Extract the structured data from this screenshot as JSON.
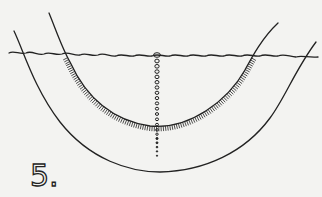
{
  "figure": {
    "label": "5."
  },
  "colors": {
    "background": "#f3f3f1",
    "ink": "#222222"
  }
}
